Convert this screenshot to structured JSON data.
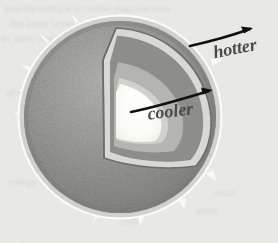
{
  "figure": {
    "kind": "cutaway-diagram",
    "background_color": "#e9e9e6",
    "paper_note": "faint illegible ghost text from the reverse of the printed page"
  },
  "sphere": {
    "name": "sun-body",
    "center_x": 120,
    "center_y": 117,
    "radius": 99,
    "surface_color": "#9a9a97",
    "surface_dark_color": "#828280",
    "surface_light_color": "#b9b9b5",
    "rim_highlight_color": "#fbfbf9",
    "texture": "granulated mottling",
    "prominence_count": 9
  },
  "wedge": {
    "name": "cutaway-wedge",
    "layers": [
      {
        "name": "cut-face-edge",
        "label": "cut surface edge",
        "color": "#d8d8d3"
      },
      {
        "name": "outer-layer",
        "label": "convective zone",
        "color": "#8d8d8a"
      },
      {
        "name": "middle-layer",
        "label": "radiative zone",
        "color": "#b4b4b0"
      },
      {
        "name": "inner-layer",
        "label": "inner zone",
        "color": "#d2d2cd"
      },
      {
        "name": "core",
        "label": "core",
        "color": "#fbfbf6"
      }
    ],
    "outline_color": "#6d6d6a"
  },
  "annotations": {
    "hotter": {
      "text": "hotter",
      "x": 236,
      "y": 54,
      "rotation": -11,
      "font_size": 18,
      "color": "#4a4a4a",
      "arrow": {
        "name": "hotter-arrow",
        "from_x": 190,
        "from_y": 46,
        "to_x": 253,
        "to_y": 28,
        "direction": "outward from surface"
      }
    },
    "cooler": {
      "text": "cooler",
      "x": 171,
      "y": 116,
      "rotation": -7,
      "font_size": 18,
      "color": "#4a4a4a",
      "arrow": {
        "name": "cooler-arrow",
        "from_x": 131,
        "from_y": 112,
        "to_x": 212,
        "to_y": 90,
        "direction": "from core outward to right rim"
      }
    }
  },
  "ghost_text": {
    "lines": [
      {
        "text": "and the surface is cooler than the core",
        "x": 4,
        "y": 12,
        "size": 11,
        "rotation": 0
      },
      {
        "text": "the inner layers a from it",
        "x": 10,
        "y": 27,
        "size": 11,
        "rotation": 0
      },
      {
        "text": "to carry energy",
        "x": 2,
        "y": 42,
        "size": 11,
        "rotation": 0
      },
      {
        "text": "of the",
        "x": 6,
        "y": 96,
        "size": 11,
        "rotation": 0
      },
      {
        "text": "is a",
        "x": 18,
        "y": 122,
        "size": 11,
        "rotation": 0
      },
      {
        "text": "energy the",
        "x": 8,
        "y": 185,
        "size": 11,
        "rotation": 0
      },
      {
        "text": "solar",
        "x": 214,
        "y": 196,
        "size": 11,
        "rotation": 0
      },
      {
        "text": "zone",
        "x": 196,
        "y": 214,
        "size": 11,
        "rotation": 0
      },
      {
        "text": "core",
        "x": 120,
        "y": 224,
        "size": 11,
        "rotation": 0
      }
    ]
  }
}
